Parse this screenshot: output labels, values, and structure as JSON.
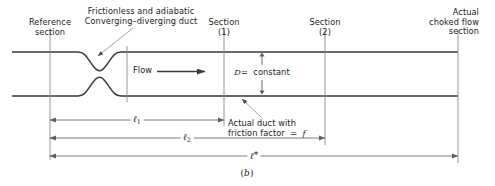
{
  "figure": {
    "caption": "(b)",
    "caption_letter": "b",
    "title_annotation": {
      "line1": "Frictionless and adiabatic",
      "line2": "Converging–diverging duct"
    },
    "labels": {
      "reference_section": "Reference\nsection",
      "section_1": "Section\n(1)",
      "section_2": "Section\n(2)",
      "actual_choked": "Actual\nchoked flow\nsection",
      "flow": "Flow",
      "diameter": "D  =  constant",
      "diameter_symbol": "D",
      "diameter_value": "=  constant",
      "actual_duct": "Actual duct with\nfriction factor  =  f",
      "actual_duct_line1": "Actual duct with",
      "actual_duct_line2": "friction factor  =  f"
    },
    "dimensions": [
      {
        "name": "l1",
        "label": "ℓ",
        "sub": "1",
        "star": ""
      },
      {
        "name": "l2",
        "label": "ℓ",
        "sub": "2",
        "star": ""
      },
      {
        "name": "lstar",
        "label": "ℓ",
        "sub": "",
        "star": "*"
      }
    ],
    "colors": {
      "wall": "#3a3a3a",
      "thin_line": "#7a7a7a",
      "dimension_line": "#6e6e6e",
      "text": "#1a1a1a",
      "background": "#ffffff"
    },
    "geometry": {
      "x_reference": 50,
      "x_throat": 99,
      "x_nozzle_end": 127,
      "x_section1": 224,
      "x_section2": 325,
      "x_choked": 458,
      "y_top_wall": 52,
      "y_bottom_wall": 96,
      "y_dim_l1": 120,
      "y_dim_l2": 138,
      "y_dim_lstar": 156
    }
  }
}
